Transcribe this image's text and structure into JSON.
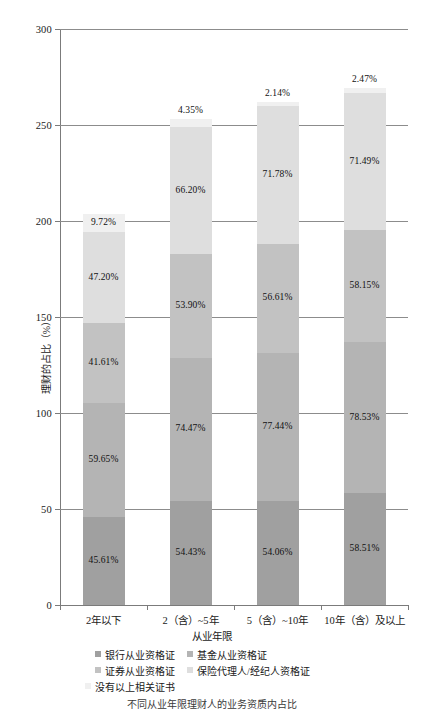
{
  "chart_data": {
    "type": "bar",
    "subtype": "stacked-bar",
    "title": "",
    "xlabel": "从业年限",
    "ylabel": "理财的占比（%）",
    "ylim": [
      0,
      300
    ],
    "ytick_values": [
      0,
      50,
      100,
      150,
      200,
      250,
      300
    ],
    "ytick_labels": [
      "0",
      "50",
      "100",
      "150",
      "200",
      "250",
      "300"
    ],
    "grid": true,
    "legend_position": "bottom",
    "categories": [
      "2年以下",
      "2（含）~5年",
      "5（含）~10年",
      "10年（含）及以上"
    ],
    "series": [
      {
        "name": "银行从业资格证",
        "color": "#a0a0a0",
        "values": [
          45.61,
          54.43,
          54.06,
          58.51
        ],
        "labels": [
          "45.61%",
          "54.43%",
          "54.06%",
          "58.51%"
        ]
      },
      {
        "name": "基金从业资格证",
        "color": "#b4b4b4",
        "values": [
          59.65,
          74.47,
          77.44,
          78.53
        ],
        "labels": [
          "59.65%",
          "74.47%",
          "77.44%",
          "78.53%"
        ]
      },
      {
        "name": "证券从业资格证",
        "color": "#c2c2c2",
        "values": [
          41.61,
          53.9,
          56.61,
          58.15
        ],
        "labels": [
          "41.61%",
          "53.90%",
          "56.61%",
          "58.15%"
        ]
      },
      {
        "name": "保险代理人/经纪人资格证",
        "color": "#dedede",
        "values": [
          47.2,
          66.2,
          71.78,
          71.49
        ],
        "labels": [
          "47.20%",
          "66.20%",
          "71.78%",
          "71.49%"
        ]
      },
      {
        "name": "没有以上相关证书",
        "color": "#f0f0f0",
        "values": [
          9.72,
          4.35,
          2.14,
          2.47
        ],
        "labels": [
          "9.72%",
          "4.35%",
          "2.14%",
          "2.47%"
        ]
      }
    ]
  },
  "axis": {
    "y_title": "理财的占比（%）",
    "x_title": "从业年限",
    "y_ticks": [
      "300",
      "250",
      "200",
      "150",
      "100",
      "50",
      "0"
    ]
  },
  "legend": {
    "row1_col1": "银行从业资格证",
    "row1_col2": "基金从业资格证",
    "row2_col1": "证券从业资格证",
    "row2_col2": "保险代理人/经纪人资格证",
    "row3_col1": "没有以上相关证书"
  },
  "caption": "不同从业年限理财人的业务资质内占比"
}
